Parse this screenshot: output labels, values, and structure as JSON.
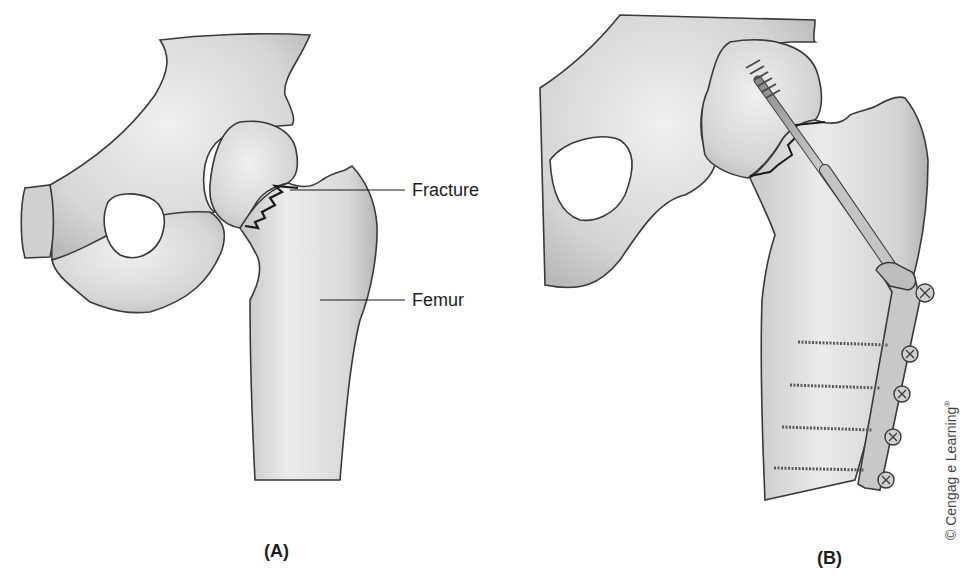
{
  "figure": {
    "panels": [
      {
        "id": "A",
        "caption": "(A)",
        "description": "Hip joint with fracture of the femoral neck",
        "labels": [
          {
            "text": "Fracture"
          },
          {
            "text": "Femur"
          }
        ]
      },
      {
        "id": "B",
        "caption": "(B)",
        "description": "Fracture fixed with a compression hip screw and side plate with four screws"
      }
    ],
    "copyright": "© Cengag e Learning",
    "copyright_mark": "®"
  },
  "colors": {
    "background": "#ffffff",
    "bone_fill": "#d9d9d9",
    "bone_light": "#ececec",
    "bone_outline": "#3a3a3a",
    "hardware_fill": "#b8b8b8",
    "text": "#1e1e1e"
  }
}
